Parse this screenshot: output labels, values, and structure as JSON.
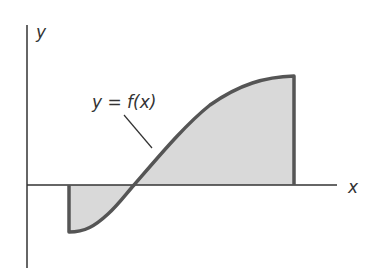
{
  "diagram": {
    "type": "area-under-curve",
    "axes": {
      "x_label": "x",
      "y_label": "y"
    },
    "curve": {
      "label": "y = f(x)",
      "description": "Curve starting below the x-axis at a minimum, rising through the x-axis and leveling off at a maximum; region between curve and x-axis is shaded from the left bound to the right bound"
    },
    "colors": {
      "curve": "#555555",
      "fill": "#d9d9d9",
      "axis": "#333333",
      "text": "#333333"
    }
  }
}
